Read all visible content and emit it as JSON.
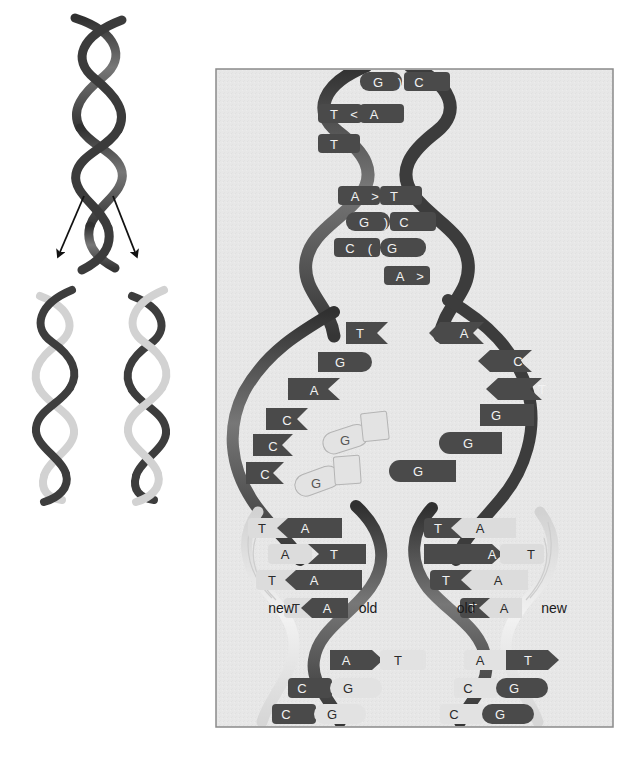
{
  "figure": {
    "background_color": "#ffffff",
    "panel_background_color": "#e7e7e7",
    "panel_border_color": "#8a8a8a",
    "strand_old_color": "#3f3f3f",
    "strand_new_color": "#d8d8d8",
    "base_dark_color": "#4a4a4a",
    "base_light_color": "#dcdcdc",
    "free_nucleotide_color": "#e0e0e0"
  },
  "overview": {
    "parent_helix": {
      "name": "parent DNA double helix",
      "strand_a_color": "#3f3f3f",
      "strand_b_color": "#3f3f3f"
    },
    "arrows": [
      {
        "name": "arrow-left",
        "direction": "down-left"
      },
      {
        "name": "arrow-right",
        "direction": "down-right"
      }
    ],
    "daughter_helices": [
      {
        "name": "daughter-helix-left",
        "old_strand_color": "#3f3f3f",
        "new_strand_color": "#d0d0d0"
      },
      {
        "name": "daughter-helix-right",
        "old_strand_color": "#3f3f3f",
        "new_strand_color": "#d0d0d0"
      }
    ]
  },
  "detail_panel": {
    "label": "replication fork detail",
    "top_duplex": {
      "label": "unreplicated parent duplex",
      "base_pairs": [
        {
          "left": "G",
          "right": "C",
          "link": ")"
        },
        {
          "left": "T",
          "right": "A",
          "link": "<"
        },
        {
          "left": "T",
          "right": "",
          "link": ""
        },
        {
          "left": "A",
          "right": "T",
          "link": ">"
        },
        {
          "left": "G",
          "right": "C",
          "link": ")"
        },
        {
          "left": "C",
          "right": "G",
          "link": "("
        },
        {
          "left": "",
          "right": "A",
          "link": ">"
        }
      ]
    },
    "fork_bubble": {
      "label": "unwound single strands at replication fork",
      "left_strand_bases": [
        "T",
        "G",
        "A",
        "C",
        "C",
        "C"
      ],
      "right_strand_bases": [
        "A",
        "C",
        "T",
        "G",
        "G",
        "G"
      ],
      "free_nucleotides": [
        {
          "base": "G",
          "name": "free-nucleotide-1"
        },
        {
          "base": "G",
          "name": "free-nucleotide-2"
        }
      ]
    },
    "daughter_left": {
      "label": "left daughter duplex",
      "left_label": "new",
      "right_label": "old",
      "base_pairs": [
        {
          "left": "T",
          "right": "A",
          "link": "<",
          "left_shade": "light",
          "right_shade": "dark"
        },
        {
          "left": "A",
          "right": "T",
          "link": ">",
          "left_shade": "light",
          "right_shade": "dark"
        },
        {
          "left": "T",
          "right": "A",
          "link": "<",
          "left_shade": "light",
          "right_shade": "dark"
        },
        {
          "left": "T",
          "right": "A",
          "link": "<",
          "left_shade": "light",
          "right_shade": "dark"
        },
        {
          "left": "A",
          "right": "T",
          "link": ">",
          "left_shade": "dark",
          "right_shade": "light"
        },
        {
          "left": "C",
          "right": "G",
          "link": "(",
          "left_shade": "dark",
          "right_shade": "light"
        },
        {
          "left": "C",
          "right": "G",
          "link": "(",
          "left_shade": "dark",
          "right_shade": "light"
        }
      ]
    },
    "daughter_right": {
      "label": "right daughter duplex",
      "left_label": "old",
      "right_label": "new",
      "base_pairs": [
        {
          "left": "T",
          "right": "A",
          "link": "<",
          "left_shade": "dark",
          "right_shade": "light"
        },
        {
          "left": "A",
          "right": "T",
          "link": ">",
          "left_shade": "dark",
          "right_shade": "light"
        },
        {
          "left": "T",
          "right": "A",
          "link": "<",
          "left_shade": "dark",
          "right_shade": "light"
        },
        {
          "left": "T",
          "right": "A",
          "link": "<",
          "left_shade": "dark",
          "right_shade": "light"
        },
        {
          "left": "A",
          "right": "T",
          "link": ">",
          "left_shade": "light",
          "right_shade": "dark"
        },
        {
          "left": "C",
          "right": "G",
          "link": "(",
          "left_shade": "light",
          "right_shade": "dark"
        },
        {
          "left": "C",
          "right": "G",
          "link": "(",
          "left_shade": "light",
          "right_shade": "dark"
        }
      ]
    }
  }
}
